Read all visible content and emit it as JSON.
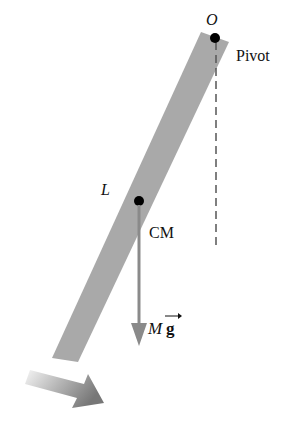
{
  "diagram": {
    "type": "physical-pendulum",
    "labels": {
      "pivot_point": "O",
      "pivot": "Pivot",
      "length": "L",
      "center_of_mass": "CM",
      "weight_mass": "M",
      "weight_g": "g"
    },
    "colors": {
      "rod": "#a9a9a9",
      "vector": "#8a8a8a",
      "dot": "#000000",
      "dashed": "#555555",
      "rotation_arrow_start": "#f2f2f2",
      "rotation_arrow_end": "#7a7a7a"
    }
  }
}
